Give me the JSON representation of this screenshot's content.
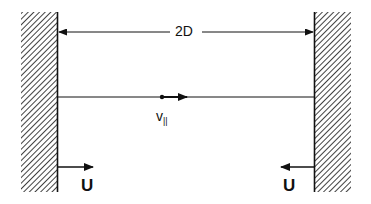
{
  "diagram": {
    "dimension_label": "2D",
    "particle_velocity_label": "v",
    "particle_velocity_subscript": "||",
    "left_wall_velocity_label": "U",
    "right_wall_velocity_label": "U",
    "colors": {
      "ink": "#111111",
      "background": "#ffffff"
    }
  }
}
